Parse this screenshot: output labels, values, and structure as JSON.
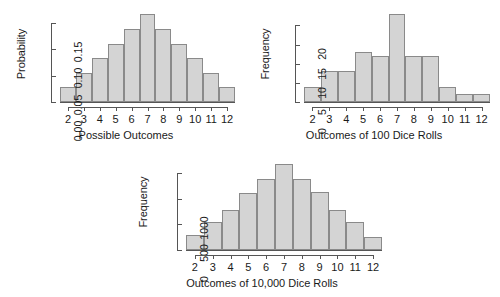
{
  "chart_data": [
    {
      "type": "bar",
      "title": "",
      "xlabel": "Possible Outcomes",
      "ylabel": "Probability",
      "categories": [
        "2",
        "3",
        "4",
        "5",
        "6",
        "7",
        "8",
        "9",
        "10",
        "11",
        "12"
      ],
      "values": [
        0.0278,
        0.0556,
        0.0833,
        0.1111,
        0.1389,
        0.1667,
        0.1389,
        0.1111,
        0.0833,
        0.0556,
        0.0278
      ],
      "ylim": [
        0,
        0.175
      ],
      "ytick_values": [
        0,
        0.05,
        0.1,
        0.15
      ],
      "ytick_labels": [
        "0.00",
        "0.05",
        "0.10",
        "0.15"
      ],
      "xtick_labels": [
        "2",
        "3",
        "4",
        "5",
        "6",
        "7",
        "8",
        "9",
        "10",
        "11",
        "12"
      ],
      "grid": false,
      "legend": "none",
      "bar_fill": "#d4d4d4",
      "bar_border": "#8a8a8a"
    },
    {
      "type": "bar",
      "title": "",
      "xlabel": "Outcomes of 100 Dice Rolls",
      "ylabel": "Frequency",
      "categories": [
        "2",
        "3",
        "4",
        "5",
        "6",
        "7",
        "8",
        "9",
        "10",
        "11",
        "12"
      ],
      "values": [
        4,
        8,
        8,
        13,
        12,
        23,
        12,
        12,
        4,
        2,
        2
      ],
      "ylim": [
        0,
        24
      ],
      "ytick_values": [
        0,
        5,
        10,
        15,
        20
      ],
      "ytick_labels": [
        "0",
        "5",
        "10",
        "15",
        "20"
      ],
      "xtick_labels": [
        "2",
        "3",
        "4",
        "5",
        "6",
        "7",
        "8",
        "9",
        "10",
        "11",
        "12"
      ],
      "grid": false,
      "legend": "none",
      "bar_fill": "#d4d4d4",
      "bar_border": "#8a8a8a"
    },
    {
      "type": "bar",
      "title": "",
      "xlabel": "Outcomes of 10,000 Dice Rolls",
      "ylabel": "Frequency",
      "categories": [
        "2",
        "3",
        "4",
        "5",
        "6",
        "7",
        "8",
        "9",
        "10",
        "11",
        "12"
      ],
      "values": [
        290,
        545,
        790,
        1120,
        1390,
        1690,
        1390,
        1140,
        790,
        545,
        255
      ],
      "ylim": [
        0,
        1800
      ],
      "ytick_values": [
        0,
        500,
        1000,
        1500
      ],
      "ytick_labels": [
        "0",
        "500",
        "1000",
        ""
      ],
      "xtick_labels": [
        "2",
        "3",
        "4",
        "5",
        "6",
        "7",
        "8",
        "9",
        "10",
        "11",
        "12"
      ],
      "grid": false,
      "legend": "none",
      "bar_fill": "#d4d4d4",
      "bar_border": "#8a8a8a"
    }
  ]
}
